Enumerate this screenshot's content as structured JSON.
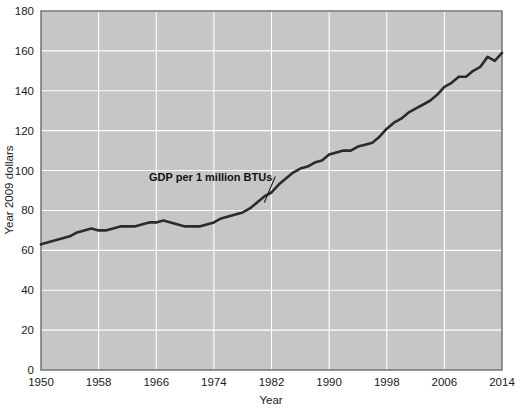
{
  "chart_data": {
    "type": "line",
    "title": "",
    "xlabel": "Year",
    "ylabel": "Year 2009 dollars",
    "xlim": [
      1950,
      2014
    ],
    "ylim": [
      0,
      180
    ],
    "grid": true,
    "legend_position": "inline-annotation",
    "xticks": [
      1950,
      1958,
      1966,
      1974,
      1982,
      1990,
      1998,
      2006,
      2014
    ],
    "yticks": [
      0,
      20,
      40,
      60,
      80,
      100,
      120,
      140,
      160,
      180
    ],
    "annotations": [
      {
        "text": "GDP per 1 million BTUs",
        "x": 1965,
        "y": 95,
        "leader_to_x": 1981,
        "leader_to_y": 84
      }
    ],
    "series": [
      {
        "name": "GDP per 1 million BTUs",
        "color": "#2b2b2b",
        "x": [
          1950,
          1951,
          1952,
          1953,
          1954,
          1955,
          1956,
          1957,
          1958,
          1959,
          1960,
          1961,
          1962,
          1963,
          1964,
          1965,
          1966,
          1967,
          1968,
          1969,
          1970,
          1971,
          1972,
          1973,
          1974,
          1975,
          1976,
          1977,
          1978,
          1979,
          1980,
          1981,
          1982,
          1983,
          1984,
          1985,
          1986,
          1987,
          1988,
          1989,
          1990,
          1991,
          1992,
          1993,
          1994,
          1995,
          1996,
          1997,
          1998,
          1999,
          2000,
          2001,
          2002,
          2003,
          2004,
          2005,
          2006,
          2007,
          2008,
          2009,
          2010,
          2011,
          2012,
          2013,
          2014
        ],
        "values": [
          63,
          64,
          65,
          66,
          67,
          69,
          70,
          71,
          70,
          70,
          71,
          72,
          72,
          72,
          73,
          74,
          74,
          75,
          74,
          73,
          72,
          72,
          72,
          73,
          74,
          76,
          77,
          78,
          79,
          81,
          84,
          87,
          89,
          93,
          96,
          99,
          101,
          102,
          104,
          105,
          108,
          109,
          110,
          110,
          112,
          113,
          114,
          117,
          121,
          124,
          126,
          129,
          131,
          133,
          135,
          138,
          142,
          144,
          147,
          147,
          150,
          152,
          157,
          155,
          159
        ]
      }
    ]
  },
  "axes": {
    "x_title": "Year",
    "y_title": "Year 2009 dollars"
  },
  "style": {
    "plot_background": "#c6c6c6",
    "grid_color": "#ffffff",
    "line_color": "#2b2b2b",
    "border_color": "#6b6b6b",
    "text_color": "#1a1a1a"
  }
}
